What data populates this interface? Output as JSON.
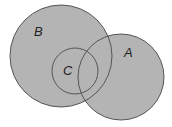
{
  "diagram": {
    "type": "venn",
    "colors": {
      "fill": "#b4b4b4",
      "stroke": "#555555",
      "background": "#ffffff"
    },
    "sets": [
      {
        "id": "B",
        "label": "B",
        "cx": 61,
        "cy": 56,
        "r": 51,
        "label_x": 34,
        "label_y": 36
      },
      {
        "id": "A",
        "label": "A",
        "cx": 121,
        "cy": 77,
        "r": 43,
        "label_x": 124,
        "label_y": 57
      },
      {
        "id": "C",
        "label": "C",
        "cx": 75,
        "cy": 71,
        "r": 23,
        "label_x": 63,
        "label_y": 75
      }
    ]
  }
}
